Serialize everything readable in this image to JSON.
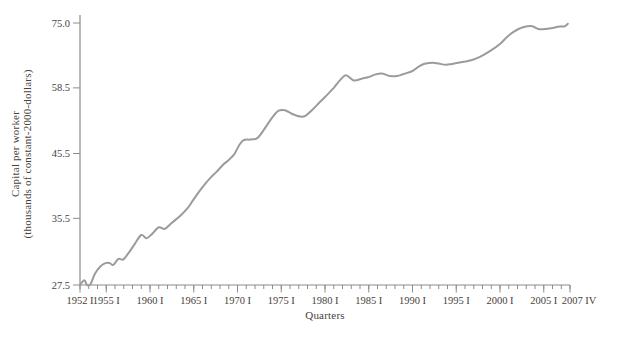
{
  "figure": {
    "background": "#ffffff"
  },
  "chart_data": {
    "type": "line",
    "title": "",
    "xlabel": "Quarters",
    "ylabel_line1": "Capital per worker",
    "ylabel_line2": "(thousands of constant-2000-dollars)",
    "y_scale": "log",
    "y_axis_range": [
      27.5,
      75.0
    ],
    "y_ticks": [
      {
        "value": 27.5,
        "label": "27.5"
      },
      {
        "value": 35.5,
        "label": "35.5"
      },
      {
        "value": 45.5,
        "label": "45.5"
      },
      {
        "value": 58.5,
        "label": "58.5"
      },
      {
        "value": 75.0,
        "label": "75.0"
      }
    ],
    "x_axis_range_years": [
      1952,
      2008
    ],
    "x_major_ticks": [
      {
        "year": 1952,
        "label": "1952 I"
      },
      {
        "year": 1955,
        "label": "1955 I"
      },
      {
        "year": 1960,
        "label": "1960 I"
      },
      {
        "year": 1965,
        "label": "1965 I"
      },
      {
        "year": 1970,
        "label": "1970 I"
      },
      {
        "year": 1975,
        "label": "1975 I"
      },
      {
        "year": 1980,
        "label": "1980 I"
      },
      {
        "year": 1985,
        "label": "1985 I"
      },
      {
        "year": 1990,
        "label": "1990 I"
      },
      {
        "year": 1995,
        "label": "1995 I"
      },
      {
        "year": 2000,
        "label": "2000 I"
      },
      {
        "year": 2005,
        "label": "2005 I"
      },
      {
        "year": 2008,
        "label": "2007 IV"
      }
    ],
    "x_minor_ticks": {
      "start_year": 1952,
      "end_year": 2008,
      "step_years": 1
    },
    "legend": "none",
    "grid": "off",
    "colors": {
      "line": "#9b9b9b",
      "axis": "#8c8c8c",
      "text": "#47423c"
    },
    "series": [
      {
        "name": "Capital per worker (thousands of constant-2000-dollars)",
        "frequency": "quarterly, 1952 I - 2007 IV (values estimated at anchor dates)",
        "points": [
          [
            1952.0,
            27.5
          ],
          [
            1952.5,
            28.0
          ],
          [
            1952.8,
            27.5
          ],
          [
            1953.2,
            27.6
          ],
          [
            1953.7,
            28.7
          ],
          [
            1954.3,
            29.5
          ],
          [
            1954.9,
            29.9
          ],
          [
            1955.4,
            29.9
          ],
          [
            1955.8,
            29.7
          ],
          [
            1956.4,
            30.4
          ],
          [
            1956.9,
            30.3
          ],
          [
            1957.5,
            31.0
          ],
          [
            1958.2,
            32.1
          ],
          [
            1959.0,
            33.3
          ],
          [
            1959.6,
            32.9
          ],
          [
            1960.2,
            33.4
          ],
          [
            1961.0,
            34.3
          ],
          [
            1961.7,
            34.1
          ],
          [
            1962.5,
            34.9
          ],
          [
            1963.5,
            35.9
          ],
          [
            1964.3,
            36.9
          ],
          [
            1965.0,
            38.2
          ],
          [
            1966.0,
            40.0
          ],
          [
            1967.0,
            41.6
          ],
          [
            1967.6,
            42.4
          ],
          [
            1968.3,
            43.5
          ],
          [
            1969.0,
            44.4
          ],
          [
            1969.6,
            45.3
          ],
          [
            1970.2,
            47.0
          ],
          [
            1970.7,
            47.9
          ],
          [
            1971.5,
            48.0
          ],
          [
            1972.3,
            48.3
          ],
          [
            1973.0,
            49.8
          ],
          [
            1974.0,
            52.3
          ],
          [
            1974.7,
            53.6
          ],
          [
            1975.4,
            53.7
          ],
          [
            1976.2,
            53.0
          ],
          [
            1977.2,
            52.4
          ],
          [
            1977.8,
            52.6
          ],
          [
            1978.5,
            53.7
          ],
          [
            1979.3,
            55.2
          ],
          [
            1980.0,
            56.5
          ],
          [
            1981.0,
            58.5
          ],
          [
            1981.7,
            60.2
          ],
          [
            1982.4,
            61.4
          ],
          [
            1983.3,
            60.2
          ],
          [
            1984.2,
            60.6
          ],
          [
            1985.0,
            61.0
          ],
          [
            1985.8,
            61.6
          ],
          [
            1986.5,
            61.8
          ],
          [
            1987.3,
            61.3
          ],
          [
            1988.2,
            61.2
          ],
          [
            1989.0,
            61.7
          ],
          [
            1990.0,
            62.4
          ],
          [
            1990.8,
            63.6
          ],
          [
            1991.5,
            64.2
          ],
          [
            1992.3,
            64.4
          ],
          [
            1993.0,
            64.2
          ],
          [
            1993.8,
            63.9
          ],
          [
            1994.5,
            64.1
          ],
          [
            1995.2,
            64.4
          ],
          [
            1996.0,
            64.7
          ],
          [
            1996.8,
            65.1
          ],
          [
            1997.7,
            65.9
          ],
          [
            1998.8,
            67.3
          ],
          [
            2000.0,
            69.2
          ],
          [
            2000.8,
            71.1
          ],
          [
            2001.5,
            72.4
          ],
          [
            2002.3,
            73.5
          ],
          [
            2003.0,
            74.0
          ],
          [
            2003.7,
            74.1
          ],
          [
            2004.4,
            73.3
          ],
          [
            2005.2,
            73.3
          ],
          [
            2006.0,
            73.6
          ],
          [
            2006.8,
            74.0
          ],
          [
            2007.4,
            74.1
          ],
          [
            2007.75,
            74.8
          ]
        ]
      }
    ]
  }
}
